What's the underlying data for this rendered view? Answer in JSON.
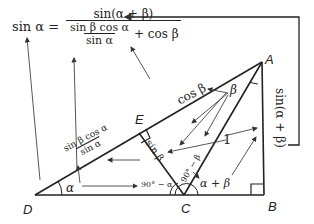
{
  "formula": {
    "lhs": "sin α =",
    "numerator": "sin(α + β)",
    "inner_numerator": "sin β cos α",
    "inner_denominator": "sin α",
    "plus_term": "+ cos β"
  },
  "vertices": {
    "A": "A",
    "B": "B",
    "C": "C",
    "D": "D",
    "E": "E"
  },
  "labels": {
    "cos_beta": "cos β",
    "beta": "β",
    "sin_alpha_plus_beta": "sin(α + β)",
    "one": "1",
    "sin_beta": "sin β",
    "ninety_minus_beta": "90° − β",
    "ninety_minus_alpha": "90° − α",
    "alpha_plus_beta": "α + β",
    "alpha": "α",
    "frac_num": "sin β cos α",
    "frac_den": "sin α"
  },
  "colors": {
    "line": "#222222",
    "arrow": "#444444",
    "background": "#ffffff"
  }
}
